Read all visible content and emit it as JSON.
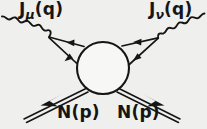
{
  "figure": {
    "kind": "feynman-diagram",
    "background_color": "#efefed",
    "ink_color": "#151515",
    "blob_fill": "#f7f7f5"
  },
  "labels": {
    "current_left": {
      "symbol": "J",
      "subscript": "μ",
      "argument": "(q)",
      "full_text": "Jμ(q)"
    },
    "current_right": {
      "symbol": "J",
      "subscript": "ν",
      "argument": "(q)",
      "full_text": "Jν(q)"
    },
    "nucleon_in": {
      "symbol": "N",
      "argument": "(p)",
      "full_text": "N(p)"
    },
    "nucleon_out": {
      "symbol": "N",
      "argument": "(p)",
      "full_text": "N(p)"
    }
  },
  "elements": {
    "blob": {
      "name": "hadronic-blob",
      "cx": 103,
      "cy": 68,
      "r": 26
    },
    "wavy_left": {
      "name": "current-line-mu",
      "from": [
        2,
        17
      ],
      "to": [
        49,
        37
      ]
    },
    "wavy_right": {
      "name": "current-line-nu",
      "from": [
        204,
        14
      ],
      "to": [
        158,
        38
      ]
    },
    "vertex_left": {
      "name": "vertex-mu",
      "x": 49,
      "y": 37
    },
    "vertex_right": {
      "name": "vertex-nu",
      "x": 158,
      "y": 38
    },
    "fermion_upper_left": {
      "name": "fermion-line-upper-left",
      "arrow_direction": "toward-blob"
    },
    "fermion_lower_left": {
      "name": "fermion-line-lower-left",
      "arrow_direction": "toward-vertex"
    },
    "fermion_upper_right": {
      "name": "fermion-line-upper-right",
      "arrow_direction": "toward-vertex"
    },
    "fermion_lower_right": {
      "name": "fermion-line-lower-right",
      "arrow_direction": "toward-vertex"
    },
    "nucleon_line_in": {
      "name": "nucleon-line-in",
      "style": "double",
      "arrow_direction": "toward-blob"
    },
    "nucleon_line_out": {
      "name": "nucleon-line-out",
      "style": "double",
      "arrow_direction": "away-from-blob"
    }
  }
}
